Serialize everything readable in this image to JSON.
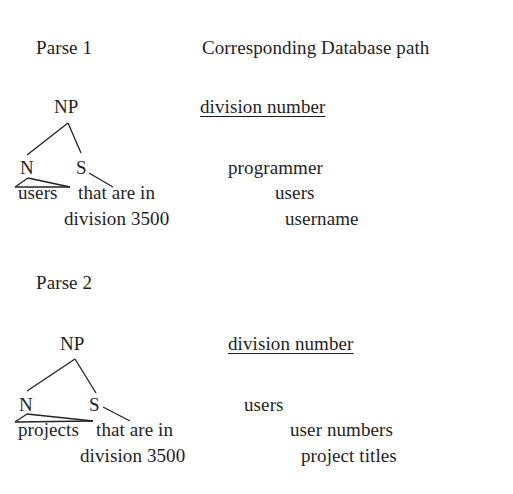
{
  "headers": {
    "left": "Parse 1",
    "right": "Corresponding Database path"
  },
  "parse1": {
    "tree": {
      "root": "NP",
      "left_child": "N",
      "right_child": "S",
      "line1": "users  that are in",
      "line1_head": "users",
      "line1_rest": "that are in",
      "line2": "division 3500"
    },
    "db_path": {
      "key": "division number",
      "items": [
        "programmer",
        "users",
        "username"
      ]
    }
  },
  "parse2": {
    "label": "Parse 2",
    "tree": {
      "root": "NP",
      "left_child": "N",
      "right_child": "S",
      "line1_head": "projects",
      "line1_rest": "that are in",
      "line2": "division 3500"
    },
    "db_path": {
      "key": "division number",
      "items": [
        "users",
        "user numbers",
        "project titles"
      ]
    }
  }
}
